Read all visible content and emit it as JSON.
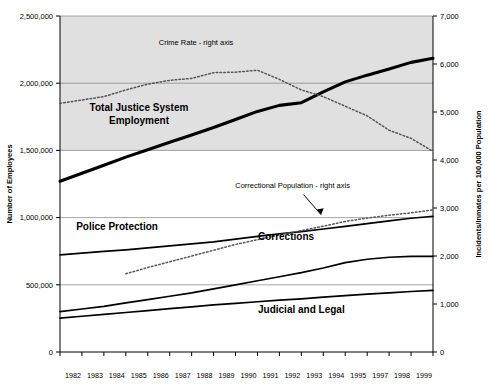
{
  "chart_data": {
    "type": "line",
    "title": "",
    "xlabel": "",
    "ylabel": "Number of Employees",
    "y2label": "Incidents/Inmates per 100,000 Population",
    "x": [
      1982,
      1983,
      1984,
      1985,
      1986,
      1987,
      1988,
      1989,
      1990,
      1991,
      1992,
      1993,
      1994,
      1995,
      1996,
      1997,
      1998,
      1999
    ],
    "xtick_labels": [
      "1982",
      "1983",
      "1984",
      "1985",
      "1986",
      "1987",
      "1988",
      "1989",
      "1990",
      "1991",
      "1992",
      "1993",
      "1994",
      "1995",
      "1997",
      "1998",
      "1999"
    ],
    "ylim": [
      0,
      2500000
    ],
    "ytick_labels": [
      "0",
      "500,000",
      "1,000,000",
      "1,500,000",
      "2,000,000",
      "2,500,000"
    ],
    "yticks": [
      0,
      500000,
      1000000,
      1500000,
      2000000,
      2500000
    ],
    "y2lim": [
      0,
      7000
    ],
    "y2tick_labels": [
      "0",
      "1,000",
      "2,000",
      "3,000",
      "4,000",
      "5,000",
      "6,000",
      "7,000"
    ],
    "y2ticks": [
      0,
      1000,
      2000,
      3000,
      4000,
      5000,
      6000,
      7000
    ],
    "grid": true,
    "legend_position": "inline-annotations",
    "shaded_band": {
      "from": 1500000,
      "to": 2500000,
      "color": "#e0e0e0"
    },
    "series": [
      {
        "name": "Total Justice System Employment",
        "axis": "left",
        "style": "solid-thick",
        "color": "#000000",
        "label_text": "Total Justice System Employment",
        "values": [
          1270000,
          1330000,
          1390000,
          1450000,
          1505000,
          1560000,
          1615000,
          1670000,
          1730000,
          1790000,
          1835000,
          1855000,
          1935000,
          2010000,
          2060000,
          2105000,
          2155000,
          2185000
        ]
      },
      {
        "name": "Police Protection",
        "axis": "left",
        "style": "solid",
        "color": "#000000",
        "label_text": "Police Protection",
        "values": [
          722000,
          735000,
          748000,
          760000,
          775000,
          790000,
          805000,
          820000,
          840000,
          860000,
          880000,
          895000,
          915000,
          935000,
          955000,
          975000,
          995000,
          1010000
        ]
      },
      {
        "name": "Corrections",
        "axis": "left",
        "style": "solid",
        "color": "#000000",
        "label_text": "Corrections",
        "values": [
          300000,
          320000,
          340000,
          365000,
          390000,
          415000,
          440000,
          470000,
          500000,
          530000,
          560000,
          590000,
          625000,
          665000,
          690000,
          705000,
          712000,
          712000
        ]
      },
      {
        "name": "Judicial and Legal",
        "axis": "left",
        "style": "solid",
        "color": "#000000",
        "label_text": "Judicial and Legal",
        "values": [
          252000,
          266000,
          280000,
          294000,
          308000,
          322000,
          336000,
          350000,
          362000,
          374000,
          386000,
          396000,
          408000,
          420000,
          430000,
          440000,
          450000,
          458000
        ]
      },
      {
        "name": "Crime Rate - right axis",
        "axis": "right",
        "style": "dotted",
        "color": "#555555",
        "label_text": "Crime Rate - right axis",
        "values": [
          5180,
          5250,
          5320,
          5460,
          5580,
          5660,
          5700,
          5820,
          5830,
          5870,
          5680,
          5460,
          5320,
          5120,
          4920,
          4620,
          4450,
          4180
        ]
      },
      {
        "name": "Correctional Population - right axis",
        "axis": "right",
        "style": "dotted",
        "color": "#555555",
        "label_text": "Correctional Population - right axis",
        "values": [
          null,
          null,
          null,
          1630,
          1760,
          1880,
          2000,
          2120,
          2240,
          2340,
          2440,
          2530,
          2620,
          2720,
          2790,
          2850,
          2900,
          2960
        ]
      }
    ],
    "annotations": [
      {
        "text": "Crime Rate - right axis",
        "x": 1988.2,
        "y_axis": "right",
        "y": 6400
      },
      {
        "text": "Correctional Population - right axis",
        "x": 1992.6,
        "y_axis": "right",
        "y": 3420
      },
      {
        "text": "Total Justice System Employment",
        "x": 1985.6,
        "y_axis": "left",
        "y": 1790000
      },
      {
        "text": "Police Protection",
        "x": 1984.6,
        "y_axis": "left",
        "y": 905000
      },
      {
        "text": "Corrections",
        "x": 1992.3,
        "y_axis": "left",
        "y": 830000
      },
      {
        "text": "Judicial and Legal",
        "x": 1993.0,
        "y_axis": "left",
        "y": 290000
      }
    ]
  }
}
